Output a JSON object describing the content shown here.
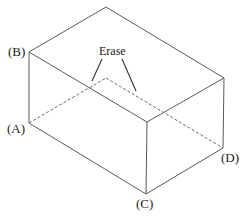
{
  "diagram": {
    "type": "rectangular box (cuboid) in isometric view",
    "colors": {
      "edge": "#5a5a5a",
      "hidden_edge": "#6a6a6a",
      "leader": "#333333",
      "text": "#222222",
      "background": "#ffffff"
    },
    "vertex_labels": {
      "A": "(A)",
      "B": "(B)",
      "C": "(C)",
      "D": "(D)"
    },
    "annotation": {
      "text": "Erase",
      "points_to": "two dashed hidden edges meeting at back-bottom vertex"
    },
    "vertices": {
      "top_back": [
        106,
        7
      ],
      "B_top_left": [
        29,
        52
      ],
      "top_right": [
        224,
        78
      ],
      "top_front": [
        147,
        122
      ],
      "A_bottom_left": [
        29,
        123
      ],
      "hidden_back_bottom": [
        106,
        78
      ],
      "D_bottom_right": [
        223,
        148
      ],
      "C_bottom_front": [
        146,
        194
      ]
    },
    "visible_edges": [
      [
        "top_back",
        "B_top_left"
      ],
      [
        "top_back",
        "top_right"
      ],
      [
        "B_top_left",
        "top_front"
      ],
      [
        "top_right",
        "top_front"
      ],
      [
        "B_top_left",
        "A_bottom_left"
      ],
      [
        "top_front",
        "C_bottom_front"
      ],
      [
        "top_right",
        "D_bottom_right"
      ],
      [
        "A_bottom_left",
        "C_bottom_front"
      ],
      [
        "C_bottom_front",
        "D_bottom_right"
      ]
    ],
    "hidden_edges": [
      [
        "A_bottom_left",
        "hidden_back_bottom"
      ],
      [
        "hidden_back_bottom",
        "D_bottom_right"
      ]
    ]
  }
}
